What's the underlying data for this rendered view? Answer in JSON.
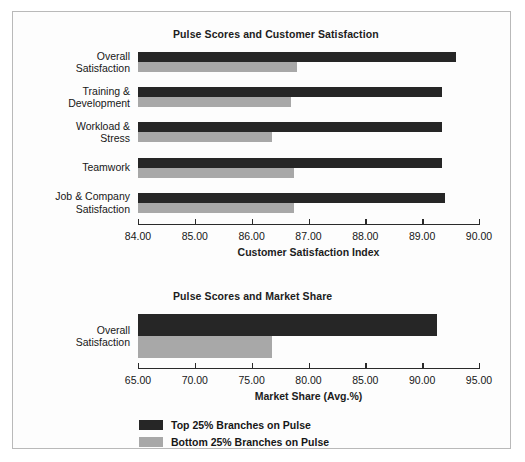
{
  "legend": {
    "items": [
      {
        "label": "Top 25% Branches on Pulse",
        "color": "#262626",
        "key": "top"
      },
      {
        "label": "Bottom 25% Branches on Pulse",
        "color": "#a8a8a8",
        "key": "bottom"
      }
    ]
  },
  "chart_data": [
    {
      "type": "bar",
      "orientation": "horizontal",
      "title": "Pulse Scores and Customer Satisfaction",
      "xlabel": "Customer Satisfaction Index",
      "ylabel": "",
      "xlim": [
        84.0,
        90.0
      ],
      "xticks": [
        84.0,
        85.0,
        86.0,
        87.0,
        88.0,
        89.0,
        90.0
      ],
      "xticklabels": [
        "84.00",
        "85.00",
        "86.00",
        "87.00",
        "88.00",
        "89.00",
        "90.00"
      ],
      "grid": false,
      "legend_position": "below-figure",
      "categories": [
        "Overall\nSatisfaction",
        "Training &\nDevelopment",
        "Workload &\nStress",
        "Teamwork",
        "Job & Company\nSatisfaction"
      ],
      "series": [
        {
          "name": "Top 25% Branches on Pulse",
          "color": "#262626",
          "values": [
            89.6,
            89.35,
            89.35,
            89.35,
            89.4
          ]
        },
        {
          "name": "Bottom 25% Branches on Pulse",
          "color": "#a8a8a8",
          "values": [
            86.8,
            86.7,
            86.35,
            86.75,
            86.75
          ]
        }
      ]
    },
    {
      "type": "bar",
      "orientation": "horizontal",
      "title": "Pulse Scores and Market Share",
      "xlabel": "Market Share (Avg.%)",
      "ylabel": "",
      "xlim": [
        65.0,
        95.0
      ],
      "xticks": [
        65.0,
        70.0,
        75.0,
        80.0,
        85.0,
        90.0,
        95.0
      ],
      "xticklabels": [
        "65.00",
        "70.00",
        "75.00",
        "80.00",
        "85.00",
        "90.00",
        "95.00"
      ],
      "grid": false,
      "legend_position": "below-figure",
      "categories": [
        "Overall\nSatisfaction"
      ],
      "series": [
        {
          "name": "Top 25% Branches on Pulse",
          "color": "#262626",
          "values": [
            91.3
          ]
        },
        {
          "name": "Bottom 25% Branches on Pulse",
          "color": "#a8a8a8",
          "values": [
            76.8
          ]
        }
      ]
    }
  ]
}
